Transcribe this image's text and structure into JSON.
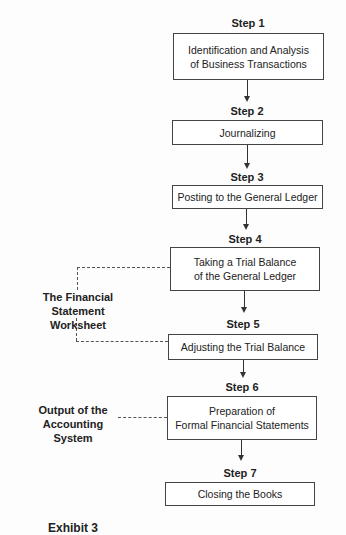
{
  "steps": [
    {
      "label": "Step 1",
      "text": "Identification and Analysis\nof Business Transactions"
    },
    {
      "label": "Step 2",
      "text": "Journalizing"
    },
    {
      "label": "Step 3",
      "text": "Posting to the General Ledger"
    },
    {
      "label": "Step 4",
      "text": "Taking a Trial Balance\nof the General Ledger"
    },
    {
      "label": "Step 5",
      "text": "Adjusting the Trial Balance"
    },
    {
      "label": "Step 6",
      "text": "Preparation of\nFormal Financial Statements"
    },
    {
      "label": "Step 7",
      "text": "Closing the Books"
    }
  ],
  "annotations": {
    "worksheet": "The Financial\nStatement Worksheet",
    "output": "Output of the\nAccounting System"
  },
  "caption": "Exhibit 3"
}
